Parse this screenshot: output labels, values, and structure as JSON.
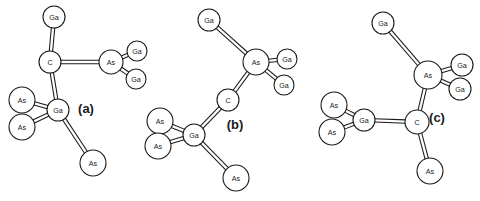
{
  "figure": {
    "background_color": "#ffffff",
    "line_color": "#1a1a1a",
    "atom_fill_color": "#ffffff",
    "caption": "",
    "panels": [
      {
        "id": "a",
        "label": "(a)",
        "label_x": 86,
        "label_y": 108,
        "atoms": [
          {
            "id": "a-ga-top",
            "element": "Ga",
            "cx": 54,
            "cy": 17,
            "r": 11
          },
          {
            "id": "a-c",
            "element": "C",
            "cx": 50,
            "cy": 62,
            "r": 11
          },
          {
            "id": "a-as-right",
            "element": "As",
            "cx": 111,
            "cy": 62,
            "r": 12
          },
          {
            "id": "a-ga-ur",
            "element": "Ga",
            "cx": 137,
            "cy": 51,
            "r": 10
          },
          {
            "id": "a-ga-lr",
            "element": "Ga",
            "cx": 136,
            "cy": 79,
            "r": 10
          },
          {
            "id": "a-ga-cen",
            "element": "Ga",
            "cx": 58,
            "cy": 110,
            "r": 11
          },
          {
            "id": "a-as-ul",
            "element": "As",
            "cx": 22,
            "cy": 100,
            "r": 13
          },
          {
            "id": "a-as-ll",
            "element": "As",
            "cx": 22,
            "cy": 127,
            "r": 13
          },
          {
            "id": "a-as-bot",
            "element": "As",
            "cx": 93,
            "cy": 163,
            "r": 13
          }
        ],
        "bonds": [
          {
            "from": "a-ga-top",
            "to": "a-c"
          },
          {
            "from": "a-c",
            "to": "a-as-right"
          },
          {
            "from": "a-as-right",
            "to": "a-ga-ur"
          },
          {
            "from": "a-as-right",
            "to": "a-ga-lr"
          },
          {
            "from": "a-c",
            "to": "a-ga-cen"
          },
          {
            "from": "a-ga-cen",
            "to": "a-as-ul"
          },
          {
            "from": "a-ga-cen",
            "to": "a-as-ll"
          },
          {
            "from": "a-ga-cen",
            "to": "a-as-bot"
          }
        ]
      },
      {
        "id": "b",
        "label": "(b)",
        "label_x": 235,
        "label_y": 124,
        "atoms": [
          {
            "id": "b-ga-top",
            "element": "Ga",
            "cx": 209,
            "cy": 20,
            "r": 11
          },
          {
            "id": "b-as-top",
            "element": "As",
            "cx": 256,
            "cy": 62,
            "r": 13
          },
          {
            "id": "b-ga-r",
            "element": "Ga",
            "cx": 287,
            "cy": 59,
            "r": 10
          },
          {
            "id": "b-ga-lr",
            "element": "Ga",
            "cx": 284,
            "cy": 85,
            "r": 10
          },
          {
            "id": "b-c",
            "element": "C",
            "cx": 228,
            "cy": 100,
            "r": 11
          },
          {
            "id": "b-ga-cen",
            "element": "Ga",
            "cx": 194,
            "cy": 135,
            "r": 11
          },
          {
            "id": "b-as-ul",
            "element": "As",
            "cx": 160,
            "cy": 121,
            "r": 13
          },
          {
            "id": "b-as-ll",
            "element": "As",
            "cx": 158,
            "cy": 146,
            "r": 13
          },
          {
            "id": "b-as-bot",
            "element": "As",
            "cx": 236,
            "cy": 178,
            "r": 13
          }
        ],
        "bonds": [
          {
            "from": "b-ga-top",
            "to": "b-as-top"
          },
          {
            "from": "b-as-top",
            "to": "b-ga-r"
          },
          {
            "from": "b-as-top",
            "to": "b-ga-lr"
          },
          {
            "from": "b-as-top",
            "to": "b-c"
          },
          {
            "from": "b-c",
            "to": "b-ga-cen"
          },
          {
            "from": "b-ga-cen",
            "to": "b-as-ul"
          },
          {
            "from": "b-ga-cen",
            "to": "b-as-ll"
          },
          {
            "from": "b-ga-cen",
            "to": "b-as-bot"
          }
        ]
      },
      {
        "id": "c",
        "label": "(c)",
        "label_x": 437,
        "label_y": 117,
        "atoms": [
          {
            "id": "c-ga-top",
            "element": "Ga",
            "cx": 383,
            "cy": 23,
            "r": 11
          },
          {
            "id": "c-as-top",
            "element": "As",
            "cx": 428,
            "cy": 75,
            "r": 14
          },
          {
            "id": "c-ga-ur",
            "element": "Ga",
            "cx": 462,
            "cy": 65,
            "r": 11
          },
          {
            "id": "c-ga-lr",
            "element": "Ga",
            "cx": 460,
            "cy": 89,
            "r": 11
          },
          {
            "id": "c-c",
            "element": "C",
            "cx": 417,
            "cy": 122,
            "r": 12
          },
          {
            "id": "c-ga-left",
            "element": "Ga",
            "cx": 364,
            "cy": 120,
            "r": 11
          },
          {
            "id": "c-as-ul",
            "element": "As",
            "cx": 334,
            "cy": 105,
            "r": 13
          },
          {
            "id": "c-as-ll",
            "element": "As",
            "cx": 332,
            "cy": 132,
            "r": 13
          },
          {
            "id": "c-as-bot",
            "element": "As",
            "cx": 430,
            "cy": 171,
            "r": 13
          }
        ],
        "bonds": [
          {
            "from": "c-ga-top",
            "to": "c-as-top"
          },
          {
            "from": "c-as-top",
            "to": "c-ga-ur"
          },
          {
            "from": "c-as-top",
            "to": "c-ga-lr"
          },
          {
            "from": "c-as-top",
            "to": "c-c"
          },
          {
            "from": "c-c",
            "to": "c-ga-left"
          },
          {
            "from": "c-ga-left",
            "to": "c-as-ul"
          },
          {
            "from": "c-ga-left",
            "to": "c-as-ll"
          },
          {
            "from": "c-c",
            "to": "c-as-bot"
          }
        ]
      }
    ]
  }
}
